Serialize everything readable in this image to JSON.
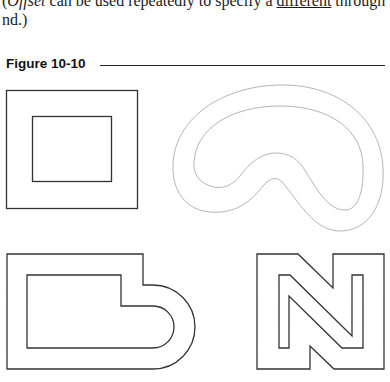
{
  "body_text": {
    "line1_pre": "(",
    "line1_italic": "Offset",
    "line1_mid": " can be used repeatedly to specify a ",
    "line1_underlined": "different",
    "line1_post": " through",
    "line2": "nd.)"
  },
  "figure": {
    "title": "Figure 10-10",
    "shapes": [
      {
        "name": "rectangle-offset",
        "description": "Outer rectangle with inner offset rectangle"
      },
      {
        "name": "kidney-offset",
        "description": "Freeform kidney-shaped curve with offset copy"
      },
      {
        "name": "polyline-arc-offset",
        "description": "Polyline with rounded end and inner offset"
      },
      {
        "name": "letter-n-offset",
        "description": "N-shaped polyline with inner offset"
      }
    ],
    "colors": {
      "stroke_dark": "#333333",
      "stroke_light": "#b5b5b5"
    }
  }
}
